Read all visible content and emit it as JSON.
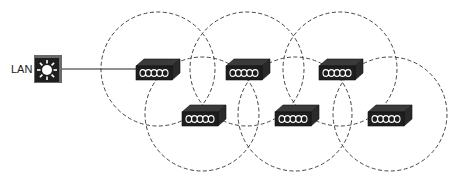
{
  "diagram": {
    "type": "wireless-mesh-coverage",
    "lan_label": "LAN",
    "colors": {
      "device_front": "#1e1e1e",
      "device_top": "#3a3a3a",
      "device_side": "#2a2a2a",
      "pattern": "#ffffff",
      "circle_stroke": "#444444",
      "link": "#222222"
    },
    "switch": {
      "x": 34,
      "y": 55,
      "size": 28,
      "icon": "sun-icon"
    },
    "uplink": {
      "x1": 62,
      "y1": 69,
      "x2": 136,
      "y2": 69
    },
    "access_points": [
      {
        "id": "ap-top-1",
        "x": 136,
        "y": 66
      },
      {
        "id": "ap-top-2",
        "x": 226,
        "y": 66
      },
      {
        "id": "ap-top-3",
        "x": 319,
        "y": 66
      },
      {
        "id": "ap-bottom-1",
        "x": 182,
        "y": 112
      },
      {
        "id": "ap-bottom-2",
        "x": 275,
        "y": 112
      },
      {
        "id": "ap-bottom-3",
        "x": 368,
        "y": 112
      }
    ],
    "coverage_cells": [
      {
        "id": "cell-top-1",
        "cx": 158,
        "cy": 69,
        "r": 57
      },
      {
        "id": "cell-top-2",
        "cx": 247,
        "cy": 69,
        "r": 57
      },
      {
        "id": "cell-top-3",
        "cx": 340,
        "cy": 69,
        "r": 57
      },
      {
        "id": "cell-bottom-1",
        "cx": 202,
        "cy": 114,
        "r": 57
      },
      {
        "id": "cell-bottom-2",
        "cx": 295,
        "cy": 114,
        "r": 57
      },
      {
        "id": "cell-bottom-3",
        "cx": 390,
        "cy": 114,
        "r": 57
      }
    ]
  }
}
